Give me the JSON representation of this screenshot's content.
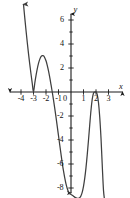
{
  "figure": {
    "kind": "cartesian-graph",
    "background": "#ffffff",
    "curve_color": "#3f3f3f",
    "axis_color": "#1a1a1a"
  },
  "axes": {
    "x_axis_name": "x",
    "y_axis_name": "y",
    "x_ticks": [
      "-4",
      "-3",
      "-2",
      "-1",
      "1",
      "2",
      "3"
    ],
    "y_ticks": [
      "6",
      "4",
      "2",
      "-2",
      "-4",
      "-6",
      "-8"
    ],
    "origin_label": "0"
  },
  "chart_data": {
    "type": "line",
    "title": "",
    "xlabel": "x",
    "ylabel": "y",
    "grid": false,
    "legend": null,
    "xlim": [
      -4.6,
      3.6
    ],
    "ylim": [
      -9.3,
      7.2
    ],
    "xticks": [
      -4,
      -3,
      -2,
      -1,
      0,
      1,
      2,
      3
    ],
    "yticks": [
      6,
      4,
      2,
      0,
      -2,
      -4,
      -6,
      -8
    ],
    "roots": [
      -3,
      -1,
      2
    ],
    "local_extrema": [
      {
        "x": -3.0,
        "y": 0.0,
        "kind": "local-min"
      },
      {
        "x": -2.0,
        "y": 3.0,
        "kind": "local-max"
      },
      {
        "x": 0.8,
        "y": -8.5,
        "kind": "local-min"
      },
      {
        "x": 2.0,
        "y": 0.0,
        "kind": "local-max"
      }
    ],
    "arrows": [
      {
        "at_x": -3.75,
        "at_y": 7.0,
        "direction": "up"
      },
      {
        "at_x": 0.0,
        "at_y": -8.9,
        "direction": "down"
      },
      {
        "at_x": 2.7,
        "at_y": -8.9,
        "direction": "down"
      }
    ],
    "series": [
      {
        "name": "f(x)",
        "x": [
          -3.8,
          -3.7,
          -3.6,
          -3.5,
          -3.4,
          -3.3,
          -3.2,
          -3.1,
          -3.0,
          -2.9,
          -2.8,
          -2.7,
          -2.6,
          -2.5,
          -2.4,
          -2.3,
          -2.2,
          -2.1,
          -2.0,
          -1.9,
          -1.8,
          -1.7,
          -1.6,
          -1.5,
          -1.4,
          -1.3,
          -1.2,
          -1.1,
          -1.0,
          -0.9,
          -0.8,
          -0.7,
          -0.6,
          -0.5,
          -0.4,
          -0.3,
          -0.2,
          -0.1,
          0.0,
          0.1,
          0.2,
          0.3,
          0.4,
          0.5,
          0.6,
          0.7,
          0.8,
          0.9,
          1.0,
          1.1,
          1.2,
          1.3,
          1.4,
          1.5,
          1.6,
          1.7,
          1.8,
          1.9,
          2.0,
          2.1,
          2.2,
          2.3,
          2.4,
          2.5,
          2.6,
          2.7
        ],
        "y": [
          7.3,
          6.2,
          5.15,
          4.15,
          3.2,
          2.32,
          1.5,
          0.72,
          0.0,
          0.72,
          1.36,
          1.92,
          2.38,
          2.72,
          2.94,
          3.03,
          3.02,
          2.86,
          2.6,
          2.22,
          1.76,
          1.22,
          0.62,
          0.0,
          -0.66,
          -1.36,
          -2.1,
          -2.86,
          -3.64,
          -4.42,
          -5.18,
          -5.92,
          -6.58,
          -7.16,
          -7.66,
          -8.04,
          -8.32,
          -8.48,
          -8.54,
          -8.6,
          -8.68,
          -8.76,
          -8.82,
          -8.86,
          -8.86,
          -8.8,
          -8.64,
          -8.34,
          -7.86,
          -7.18,
          -6.3,
          -5.22,
          -4.0,
          -2.72,
          -1.52,
          -0.6,
          -0.1,
          0.0,
          0.0,
          -0.22,
          -0.9,
          -2.1,
          -3.84,
          -6.1,
          -8.2,
          -9.1
        ]
      }
    ]
  },
  "tick_positions": {
    "x": [
      {
        "label": "-4",
        "left": 16,
        "top": 101
      },
      {
        "label": "-3",
        "left": 28,
        "top": 101
      },
      {
        "label": "-2",
        "left": 41,
        "top": 101
      },
      {
        "label": "-1",
        "left": 54,
        "top": 101
      },
      {
        "label": "1",
        "left": 84,
        "top": 101
      },
      {
        "label": "2",
        "left": 96,
        "top": 101
      },
      {
        "label": "3",
        "left": 109,
        "top": 101
      }
    ],
    "y": [
      {
        "label": "6",
        "right": 66,
        "top": 20
      },
      {
        "label": "4",
        "right": 66,
        "top": 44
      },
      {
        "label": "2",
        "right": 66,
        "top": 68
      },
      {
        "label": "-2",
        "right": 67,
        "top": 116
      },
      {
        "label": "-4",
        "right": 67,
        "top": 140
      },
      {
        "label": "-6",
        "right": 67,
        "top": 164
      },
      {
        "label": "-8",
        "right": 67,
        "top": 188
      }
    ],
    "origin": {
      "left": 64,
      "top": 100
    },
    "x_name": {
      "left": 120,
      "top": 84
    },
    "y_name": {
      "left": 74,
      "top": 6
    }
  }
}
